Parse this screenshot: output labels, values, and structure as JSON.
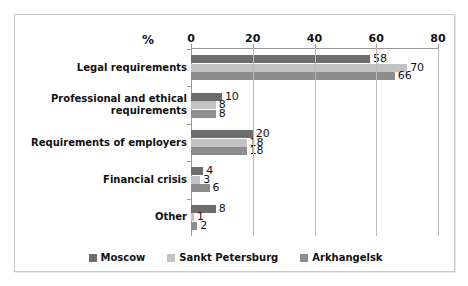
{
  "chart_data": {
    "type": "bar",
    "orientation": "horizontal",
    "title": "",
    "xlabel": "%",
    "ylabel": "",
    "xlim": [
      0,
      80
    ],
    "xticks": [
      0,
      20,
      40,
      60,
      80
    ],
    "grid": true,
    "legend_position": "bottom",
    "axis_position": "top",
    "categories": [
      "Legal requirements",
      "Professional and ethical requirements",
      "Requirements of employers",
      "Financial crisis",
      "Other"
    ],
    "series": [
      {
        "name": "Moscow",
        "color": "#6d6d6d",
        "values": [
          58,
          10,
          20,
          4,
          8
        ]
      },
      {
        "name": "Sankt Petersburg",
        "color": "#c2c2c2",
        "values": [
          70,
          8,
          18,
          3,
          1
        ]
      },
      {
        "name": "Arkhangelsk",
        "color": "#8d8d8d",
        "values": [
          66,
          8,
          18,
          6,
          2
        ]
      }
    ]
  },
  "axis": {
    "unit_label": "%",
    "tick_labels": [
      "0",
      "20",
      "40",
      "60",
      "80"
    ]
  },
  "legend": {
    "items": [
      {
        "label": "Moscow"
      },
      {
        "label": "Sankt Petersburg"
      },
      {
        "label": "Arkhangelsk"
      }
    ]
  }
}
